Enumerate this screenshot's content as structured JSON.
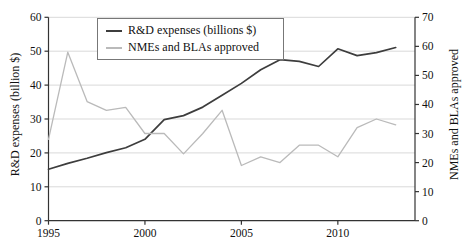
{
  "chart_data": {
    "type": "line",
    "x": [
      1995,
      1996,
      1997,
      1998,
      1999,
      2000,
      2001,
      2002,
      2003,
      2004,
      2005,
      2006,
      2007,
      2008,
      2009,
      2010,
      2011,
      2012,
      2013
    ],
    "series": [
      {
        "name": "R&D expenses (billions $)",
        "axis": "left",
        "color": "#3d3d3d",
        "values": [
          15.2,
          16.9,
          18.4,
          20.1,
          21.5,
          24.0,
          29.8,
          31.0,
          33.5,
          37.0,
          40.5,
          44.5,
          47.5,
          47.0,
          45.5,
          50.7,
          48.7,
          49.6,
          51.1
        ]
      },
      {
        "name": "NMEs and BLAs approved",
        "axis": "right",
        "color": "#bababa",
        "values": [
          28,
          58,
          41,
          38,
          39,
          30,
          30,
          23,
          30,
          38,
          19,
          22,
          20,
          26,
          26,
          22,
          32,
          35,
          33
        ]
      }
    ],
    "left_axis": {
      "label": "R&D expenses (billion $)",
      "min": 0,
      "max": 60,
      "ticks": [
        0,
        10,
        20,
        30,
        40,
        50,
        60
      ]
    },
    "right_axis": {
      "label": "NMEs and BLAs approved",
      "min": 0,
      "max": 70,
      "ticks": [
        0,
        10,
        20,
        30,
        40,
        50,
        60,
        70
      ]
    },
    "x_axis": {
      "min": 1995,
      "max": 2014,
      "ticks": [
        1995,
        2000,
        2005,
        2010
      ]
    },
    "grid": {
      "horizontal": true,
      "vertical": false,
      "color": "#d9d9d9"
    },
    "spine_color": "#333333",
    "tick_label_color": "#111111",
    "legend_position": "top-center"
  }
}
